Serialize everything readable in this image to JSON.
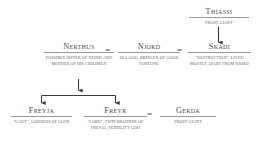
{
  "diagram": {
    "line_color": "#9a9a9a",
    "text_color": "#4a4a4a",
    "background": "#ffffff",
    "union_symbol_1": "=",
    "union_symbol_2": "=",
    "union_symbol_3": "="
  },
  "nodes": {
    "thiassi": {
      "name": "Thiassi",
      "desc": "Frost Giant"
    },
    "nerthus": {
      "name": "Nerthus",
      "desc": "Possibly sister of Njord and mother of his children"
    },
    "njord": {
      "name": "Njord",
      "desc": "Sea god, bringer of good fortune"
    },
    "skadi": {
      "name": "Skadi",
      "desc": "\"Destruction\", lived mostly apart from Njord"
    },
    "freyja": {
      "name": "Freyja",
      "desc": "\"Lady\", goddess of love"
    },
    "freyr": {
      "name": "Freyr",
      "desc": "\"Lord\", twin brother of Freyja, fertility god"
    },
    "gerda": {
      "name": "Gerda",
      "desc": "Frost Giant"
    }
  }
}
